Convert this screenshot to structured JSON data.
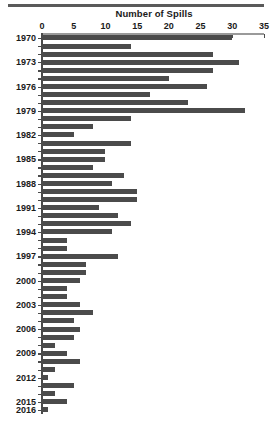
{
  "chart_data": {
    "type": "bar",
    "orientation": "horizontal",
    "title": "Number of Spills",
    "xlabel": "",
    "ylabel": "",
    "xlim": [
      0,
      35
    ],
    "ylim": [
      1970,
      2016
    ],
    "grid": false,
    "legend": null,
    "bar_color": "#4b4b4b",
    "axis_color": "#4a4a4a",
    "x_ticks": [
      0,
      5,
      10,
      15,
      20,
      25,
      30,
      35
    ],
    "x_tick_labels": [
      "0",
      "5",
      "10",
      "15",
      "20",
      "25",
      "30",
      "35"
    ],
    "y_tick_labels": [
      "1970",
      "1973",
      "1976",
      "1979",
      "1982",
      "1985",
      "1988",
      "1991",
      "1994",
      "1997",
      "2000",
      "2003",
      "2006",
      "2009",
      "2012",
      "2015",
      "2016"
    ],
    "categories": [
      "1970",
      "1971",
      "1972",
      "1973",
      "1974",
      "1975",
      "1976",
      "1977",
      "1978",
      "1979",
      "1980",
      "1981",
      "1982",
      "1983",
      "1984",
      "1985",
      "1986",
      "1987",
      "1988",
      "1989",
      "1990",
      "1991",
      "1992",
      "1993",
      "1994",
      "1995",
      "1996",
      "1997",
      "1998",
      "1999",
      "2000",
      "2001",
      "2002",
      "2003",
      "2004",
      "2005",
      "2006",
      "2007",
      "2008",
      "2009",
      "2010",
      "2011",
      "2012",
      "2013",
      "2014",
      "2015",
      "2016"
    ],
    "values": [
      30,
      14,
      27,
      31,
      27,
      20,
      26,
      17,
      23,
      32,
      14,
      8,
      5,
      14,
      10,
      10,
      8,
      13,
      11,
      15,
      15,
      9,
      12,
      14,
      11,
      4,
      4,
      12,
      7,
      7,
      6,
      4,
      4,
      6,
      8,
      5,
      6,
      5,
      2,
      4,
      6,
      2,
      1,
      5,
      2,
      4,
      1
    ]
  }
}
